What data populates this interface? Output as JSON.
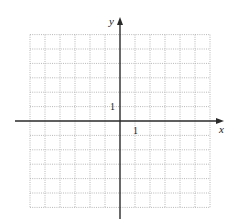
{
  "graph": {
    "x_axis_label": "x",
    "y_axis_label": "y",
    "x_tick_label": "1",
    "y_tick_label": "1",
    "x_range": [
      -6,
      6
    ],
    "y_range": [
      -6,
      6
    ],
    "grid_step": 1,
    "grid_style": "dotted",
    "colors": {
      "grid": "#b8b8b8",
      "axis": "#2a2a2a",
      "background": "#ffffff"
    }
  }
}
